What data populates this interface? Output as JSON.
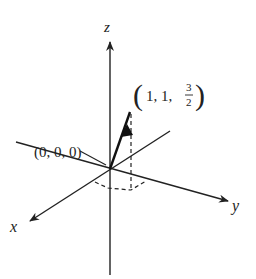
{
  "diagram": {
    "type": "3d-axes-vector",
    "axes": {
      "x_label": "x",
      "y_label": "y",
      "z_label": "z"
    },
    "points": {
      "origin_label": "(0, 0, 0)",
      "tip_label_prefix": "1, 1, ",
      "tip_frac_num": "3",
      "tip_frac_den": "2",
      "tip_open_paren": "(",
      "tip_close_paren": ")"
    },
    "vector": {
      "from": [
        0,
        0,
        0
      ],
      "to": [
        1,
        1,
        1.5
      ]
    },
    "colors": {
      "ink": "#222222",
      "background": "#ffffff"
    }
  }
}
